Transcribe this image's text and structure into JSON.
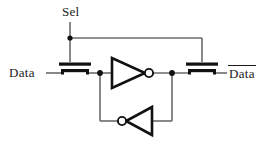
{
  "figure": {
    "kind": "circuit-schematic",
    "background_color": "#ffffff",
    "wire_color": "#6b6b6b",
    "device_color": "#111111",
    "label_color": "#1a1a1a"
  },
  "labels": {
    "select": "Sel",
    "data_in": "Data",
    "data_out": "Data",
    "data_out_overbar": true
  },
  "nodes": {
    "sel_junction": {
      "x": 70,
      "y": 38
    },
    "left_node": {
      "x": 100,
      "y": 73
    },
    "right_node": {
      "x": 172,
      "y": 73
    }
  },
  "devices": [
    {
      "name": "pass-transistor-left",
      "type": "nmos-pass-gate",
      "gate_x": 75,
      "channel_y": 70,
      "gate_bar_y": 64
    },
    {
      "name": "inverter-forward",
      "type": "inverter",
      "direction": "right",
      "input_x": 112,
      "output_x": 145,
      "center_y": 73,
      "bubble_x": 149
    },
    {
      "name": "inverter-feedback",
      "type": "inverter",
      "direction": "left",
      "input_x": 152,
      "output_x": 126,
      "center_y": 121,
      "bubble_x": 122
    },
    {
      "name": "pass-transistor-right",
      "type": "nmos-pass-gate",
      "gate_x": 202,
      "channel_y": 70,
      "gate_bar_y": 64
    }
  ]
}
